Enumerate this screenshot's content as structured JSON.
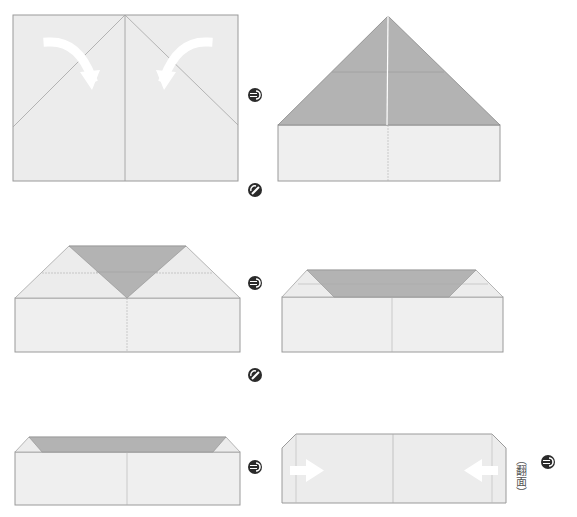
{
  "colors": {
    "paper": "#ececec",
    "paper_light": "#efefef",
    "folded": "#b3b3b3",
    "line": "#9a9a9a",
    "arrow": "#ffffff",
    "icon": "#2a2a2a"
  },
  "steps": [
    {
      "id": 1,
      "description": "Rectangle sheet with center crease; fold both top corners down to center line",
      "arrows": [
        "curved-fold-arrow-right",
        "curved-fold-arrow-left"
      ]
    },
    {
      "id": 2,
      "description": "Triangle (folded corners, dark) atop rectangle strip"
    },
    {
      "id": 3,
      "description": "Trapezoid with inverted dark triangle over rectangle"
    },
    {
      "id": 4,
      "description": "Flattened trapezoid band over rectangle"
    },
    {
      "id": 5,
      "description": "Narrow band over rectangle"
    },
    {
      "id": 6,
      "description": "Flipped shape with side folds; push ends inward",
      "arrows": [
        "push-arrow-right",
        "push-arrow-left"
      ]
    }
  ],
  "step_indicators": [
    {
      "type": "next-step",
      "x": 255,
      "y": 95
    },
    {
      "type": "next-row",
      "x": 255,
      "y": 190
    },
    {
      "type": "next-step",
      "x": 255,
      "y": 283
    },
    {
      "type": "next-row",
      "x": 255,
      "y": 375
    },
    {
      "type": "next-step",
      "x": 255,
      "y": 467
    },
    {
      "type": "next-step",
      "x": 548,
      "y": 462
    }
  ],
  "flip_label": "（翻面）"
}
